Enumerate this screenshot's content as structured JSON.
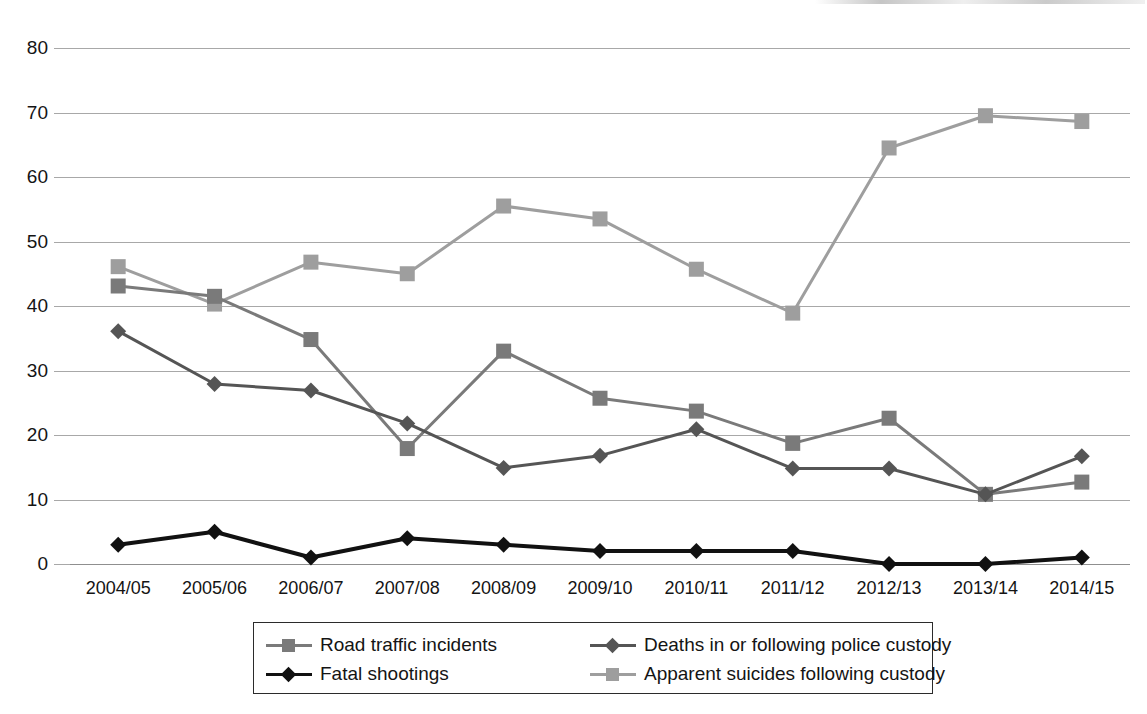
{
  "chart_data": {
    "type": "line",
    "title": "",
    "subtitle": "",
    "xlabel": "",
    "ylabel": "",
    "categories": [
      "2004/05",
      "2005/06",
      "2006/07",
      "2007/08",
      "2008/09",
      "2009/10",
      "2010/11",
      "2011/12",
      "2012/13",
      "2013/14",
      "2014/15"
    ],
    "ylim": [
      0,
      80
    ],
    "yticks": [
      0,
      10,
      20,
      30,
      40,
      50,
      60,
      70,
      80
    ],
    "grid": true,
    "legend_position": "bottom",
    "series": [
      {
        "name": "Road traffic incidents",
        "color": "#7a7a7a",
        "marker": "square",
        "values": [
          43.1,
          41.5,
          34.8,
          17.9,
          33.0,
          25.7,
          23.7,
          18.7,
          22.6,
          10.8,
          12.7
        ]
      },
      {
        "name": "Deaths in or following police custody",
        "color": "#555555",
        "marker": "diamond",
        "values": [
          36.1,
          27.9,
          26.9,
          21.8,
          14.9,
          16.8,
          20.9,
          14.8,
          14.8,
          10.8,
          16.7
        ]
      },
      {
        "name": "Fatal shootings",
        "color": "#111111",
        "marker": "diamond",
        "values": [
          3,
          5,
          1,
          4,
          3,
          2,
          2,
          2,
          0,
          0,
          1
        ]
      },
      {
        "name": "Apparent suicides following custody",
        "color": "#9e9e9e",
        "marker": "square",
        "values": [
          46.1,
          40.3,
          46.8,
          45.0,
          55.5,
          53.5,
          45.7,
          38.9,
          64.5,
          69.5,
          68.6
        ]
      }
    ]
  },
  "legend": {
    "entries": [
      {
        "label": "Road traffic incidents",
        "color": "#7a7a7a",
        "marker": "square"
      },
      {
        "label": "Deaths in or following police custody",
        "color": "#555555",
        "marker": "diamond"
      },
      {
        "label": "Fatal shootings",
        "color": "#111111",
        "marker": "diamond"
      },
      {
        "label": "Apparent suicides following custody",
        "color": "#9e9e9e",
        "marker": "square"
      }
    ]
  }
}
